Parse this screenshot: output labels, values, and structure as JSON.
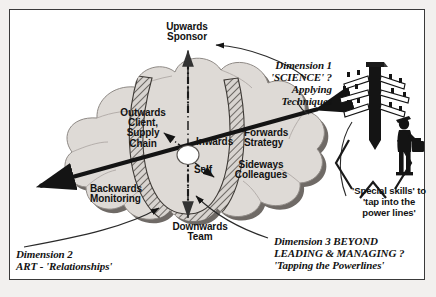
{
  "diagram": {
    "title_hidden": "",
    "center_node": "",
    "cloud_labels": [
      {
        "id": "upwards",
        "lines": "Upwards\nSponsor",
        "align": "center"
      },
      {
        "id": "outwards",
        "lines": "Outwards\nClient,\nSupply\nChain",
        "align": "center"
      },
      {
        "id": "inwards",
        "lines": "Inwards",
        "align": "left"
      },
      {
        "id": "self",
        "lines": "Self",
        "align": "left"
      },
      {
        "id": "forwards",
        "lines": "Forwards\nStrategy",
        "align": "left"
      },
      {
        "id": "sideways",
        "lines": "Sideways\nColleagues",
        "align": "center"
      },
      {
        "id": "backwards",
        "lines": "Backwards\nMonitoring",
        "align": "left"
      },
      {
        "id": "downwards",
        "lines": "Downwards\nTeam",
        "align": "center"
      }
    ],
    "dimension_1": "Dimension 1\n'SCIENCE' ?\nApplying\nTechniques",
    "dimension_2": "Dimension 2\nART - 'Relationships'",
    "dimension_3": "Dimension 3 BEYOND\nLEADING & MANAGING ?\n'Tapping the Powerlines'",
    "powerlines_note": "'Special skills' to\n'tap into the\npower lines'",
    "icons": {
      "utility_pole": "utility-pole-icon",
      "person_with_briefcase": "person-briefcase-icon",
      "center_hub": "center-hub-node"
    },
    "colors": {
      "cloud_fill": "#dedad6",
      "cloud_shadow": "#6f6a66",
      "cloud_outline": "#9a9490",
      "axis_black": "#141414",
      "hatch_band": "#cfcac6",
      "page_bg": "#f2f0ee",
      "frame_border": "#3a3a3a",
      "text": "#121212"
    }
  }
}
